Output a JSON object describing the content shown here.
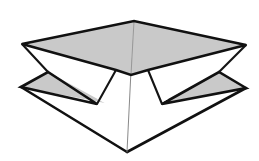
{
  "figure": {
    "background_color": "#ffffff",
    "line_color": "#111111",
    "shaded_face_color": "#c9c9c9",
    "white_face_color": "#ffffff",
    "thin_line_color": "#7a7a7a",
    "canvas": {
      "width": 259,
      "height": 161
    },
    "vertices": {
      "top_apex": [
        134,
        21
      ],
      "upper_left": [
        22,
        44
      ],
      "upper_right": [
        246,
        45
      ],
      "upper_front_center": [
        131,
        75
      ],
      "lower_left": [
        21,
        87
      ],
      "lower_right": [
        246,
        88
      ],
      "lower_front_apex": [
        127,
        152
      ],
      "left_leg_outer": [
        97,
        104
      ],
      "left_leg_inner": [
        116,
        70
      ],
      "right_leg_inner": [
        148,
        70
      ],
      "right_leg_outer": [
        162,
        104
      ],
      "left_notch_tip": [
        48,
        72
      ],
      "right_notch_tip": [
        219,
        72
      ]
    },
    "faces": [
      {
        "name": "upper-plate-left-half",
        "shading": "shaded",
        "points": "22,44 134,21 131,75 116,70"
      },
      {
        "name": "upper-plate-right-half",
        "shading": "shaded",
        "points": "134,21 246,45 148,70 131,75"
      },
      {
        "name": "lower-plate-left-wing",
        "shading": "shaded",
        "points": "21,87 48,72 105,103"
      },
      {
        "name": "lower-plate-right-wing",
        "shading": "shaded",
        "points": "246,88 219,72 161,103"
      },
      {
        "name": "lower-front-left-panel",
        "shading": "white",
        "points": "21,87 105,103 127,152"
      },
      {
        "name": "lower-front-right-panel",
        "shading": "white",
        "points": "246,88 161,103 127,152"
      }
    ],
    "edges": [
      {
        "name": "upper-plate-back-left-edge",
        "weight": "heavy"
      },
      {
        "name": "upper-plate-back-right-edge",
        "weight": "heavy"
      },
      {
        "name": "upper-plate-front-left-edge",
        "weight": "heavy"
      },
      {
        "name": "upper-plate-front-right-edge",
        "weight": "heavy"
      },
      {
        "name": "upper-plate-center-crease",
        "weight": "thin"
      },
      {
        "name": "left-leg",
        "weight": "medium"
      },
      {
        "name": "right-leg",
        "weight": "medium"
      },
      {
        "name": "central-axis",
        "weight": "thin"
      },
      {
        "name": "lower-plate-left-wing-edge",
        "weight": "heavy"
      },
      {
        "name": "lower-plate-right-wing-edge",
        "weight": "heavy"
      },
      {
        "name": "lower-plate-front-left-edge",
        "weight": "heavy"
      },
      {
        "name": "lower-plate-front-right-edge",
        "weight": "heavy"
      }
    ],
    "annotations": []
  }
}
